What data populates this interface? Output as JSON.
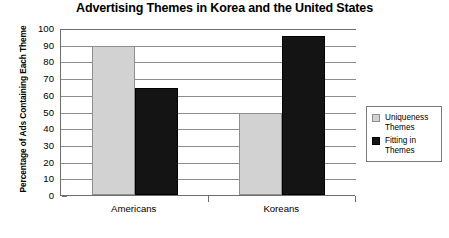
{
  "chart_data": {
    "type": "bar",
    "title": "Advertising Themes in Korea and the United States",
    "xlabel": "",
    "ylabel": "Percentage of Ads Containing Each Theme",
    "categories": [
      "Americans",
      "Koreans"
    ],
    "series": [
      {
        "name": "Uniqueness Themes",
        "values": [
          89,
          49
        ],
        "color": "#d2d2d2"
      },
      {
        "name": "Fitting in Themes",
        "values": [
          64,
          95
        ],
        "color": "#141414"
      }
    ],
    "ylim": [
      0,
      100
    ],
    "ytick_labels": [
      "100",
      "90",
      "80",
      "70",
      "60",
      "50",
      "40",
      "30",
      "20",
      "10",
      "0"
    ],
    "ytick_values": [
      100,
      90,
      80,
      70,
      60,
      50,
      40,
      30,
      20,
      10,
      0
    ],
    "grid": true,
    "legend_position": "right"
  },
  "legend": {
    "entries": [
      {
        "label": "Uniqueness Themes",
        "swatch": "uniqueness-swatch-icon"
      },
      {
        "label": "Fitting in Themes",
        "swatch": "fitting-swatch-icon"
      }
    ]
  }
}
